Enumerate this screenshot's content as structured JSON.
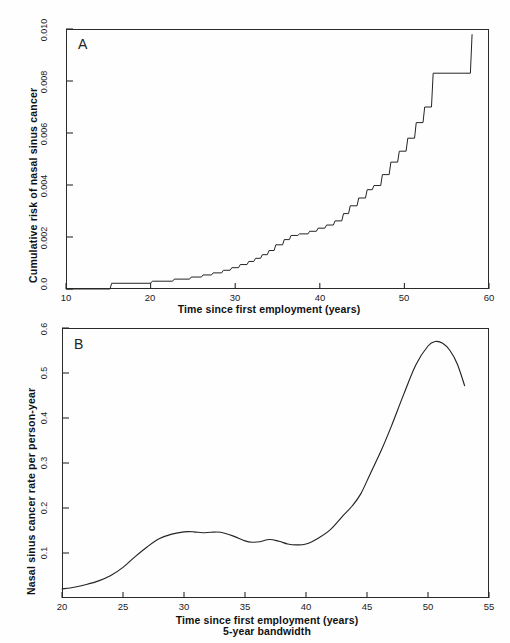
{
  "figure": {
    "background": "#fefefe",
    "line_color": "#242424",
    "axis_color": "#2a2a2a"
  },
  "panels": {
    "a": {
      "letter": "A",
      "ylabel": "Cumulative risk of nasal sinus cancer",
      "xlabel": "Time since first employment (years)",
      "xticks": [
        "10",
        "20",
        "30",
        "40",
        "50",
        "60"
      ],
      "yticks": [
        "0.010",
        "0.008",
        "0.006",
        "0.004",
        "0.002",
        "0.0"
      ]
    },
    "b": {
      "letter": "B",
      "ylabel": "Nasal sinus cancer rate per person-year",
      "xlabel": "Time since first employment (years)",
      "xlabel_sub": "5-year bandwidth",
      "xticks": [
        "20",
        "25",
        "30",
        "35",
        "40",
        "45",
        "50",
        "55"
      ],
      "yticks": [
        "0.6",
        "0.5",
        "0.4",
        "0.3",
        "0.2",
        "0.1"
      ]
    }
  },
  "chart_data": [
    {
      "type": "line",
      "panel": "A",
      "title": "Cumulative risk of nasal sinus cancer",
      "xlabel": "Time since first employment (years)",
      "ylabel": "Cumulative risk of nasal sinus cancer",
      "xlim": [
        10,
        60
      ],
      "ylim": [
        0.0,
        0.01
      ],
      "xtick_values": [
        10,
        20,
        30,
        40,
        50,
        60
      ],
      "ytick_values": [
        0.0,
        0.002,
        0.004,
        0.006,
        0.008,
        0.01
      ],
      "grid": false,
      "legend": "none",
      "step_style": "post",
      "series": [
        {
          "name": "Cumulative risk",
          "x": [
            10,
            15.2,
            15.4,
            20.0,
            20.2,
            22.6,
            22.8,
            24.6,
            24.8,
            26.0,
            26.2,
            27.2,
            27.4,
            28.4,
            28.6,
            29.4,
            29.6,
            30.4,
            30.6,
            31.4,
            31.6,
            32.2,
            32.4,
            33.0,
            33.2,
            33.8,
            34.0,
            34.6,
            34.8,
            35.6,
            35.8,
            36.4,
            36.6,
            37.4,
            37.6,
            38.6,
            38.8,
            39.6,
            39.8,
            40.6,
            40.8,
            41.6,
            41.8,
            42.6,
            42.8,
            43.4,
            43.6,
            44.4,
            44.6,
            45.4,
            45.6,
            46.2,
            46.4,
            47.2,
            47.4,
            48.2,
            48.4,
            49.2,
            49.4,
            50.2,
            50.4,
            51.2,
            51.4,
            52.2,
            52.4,
            53.2,
            53.4,
            57.8,
            58.0,
            58.0
          ],
          "y": [
            0.0,
            0.0,
            0.00022,
            0.00022,
            0.0003,
            0.0003,
            0.00038,
            0.00038,
            0.00046,
            0.00046,
            0.00054,
            0.00054,
            0.00062,
            0.00062,
            0.00072,
            0.00072,
            0.00082,
            0.00082,
            0.00094,
            0.00094,
            0.00106,
            0.00106,
            0.00118,
            0.00118,
            0.00132,
            0.00132,
            0.00148,
            0.00148,
            0.0017,
            0.0017,
            0.0019,
            0.0019,
            0.00206,
            0.00206,
            0.00212,
            0.00212,
            0.00222,
            0.00222,
            0.00234,
            0.00234,
            0.00246,
            0.00246,
            0.00262,
            0.00262,
            0.0029,
            0.0029,
            0.0032,
            0.0032,
            0.0035,
            0.0035,
            0.00382,
            0.00382,
            0.00398,
            0.00398,
            0.0044,
            0.0044,
            0.00488,
            0.00488,
            0.0053,
            0.0053,
            0.0058,
            0.0058,
            0.0064,
            0.0064,
            0.007,
            0.007,
            0.0083,
            0.0083,
            0.0098,
            0.0098
          ]
        }
      ],
      "description": "Monotonically increasing step (Kaplan-Meier cumulative risk) curve beginning near 15 years at essentially zero risk and rising to about 0.0098 by 58 years, with acceleration after 42 years and a large final jump near 58 years."
    },
    {
      "type": "line",
      "panel": "B",
      "title": "Nasal sinus cancer rate per person-year",
      "xlabel": "Time since first employment (years)",
      "xlabel_sub": "5-year bandwidth",
      "ylabel": "Nasal sinus cancer rate per person-year",
      "xlim": [
        20,
        55
      ],
      "ylim": [
        0.0,
        0.6
      ],
      "xtick_values": [
        20,
        25,
        30,
        35,
        40,
        45,
        50,
        55
      ],
      "ytick_values": [
        0.1,
        0.2,
        0.3,
        0.4,
        0.5,
        0.6
      ],
      "grid": false,
      "legend": "none",
      "series": [
        {
          "name": "Smoothed rate",
          "x": [
            20.0,
            21.0,
            22.0,
            23.0,
            24.0,
            25.0,
            26.0,
            27.0,
            28.0,
            29.0,
            30.0,
            30.8,
            31.5,
            32.2,
            33.0,
            34.0,
            35.0,
            35.6,
            36.2,
            37.0,
            37.8,
            38.5,
            39.2,
            40.0,
            41.0,
            42.0,
            43.0,
            43.8,
            44.5,
            45.3,
            46.2,
            47.0,
            48.0,
            49.0,
            50.0,
            50.6,
            51.2,
            51.8,
            52.4,
            53.0
          ],
          "y": [
            0.02,
            0.024,
            0.03,
            0.038,
            0.05,
            0.068,
            0.092,
            0.114,
            0.132,
            0.142,
            0.147,
            0.147,
            0.145,
            0.146,
            0.146,
            0.138,
            0.127,
            0.124,
            0.125,
            0.13,
            0.126,
            0.12,
            0.118,
            0.12,
            0.133,
            0.152,
            0.182,
            0.205,
            0.232,
            0.278,
            0.33,
            0.382,
            0.452,
            0.518,
            0.56,
            0.57,
            0.566,
            0.55,
            0.52,
            0.472
          ]
        }
      ],
      "description": "Kernel-smoothed incidence rate curve with 5-year bandwidth: low near 0.02 at 20 years, rising to a plateau near 0.147 around 30-33 years, a shallow dip with a small secondary bump near 37 years, then a steep rise after 42 years to a maximum of about 0.57 near 50.5 years, followed by a decline to roughly 0.47 at 53 years."
    }
  ]
}
